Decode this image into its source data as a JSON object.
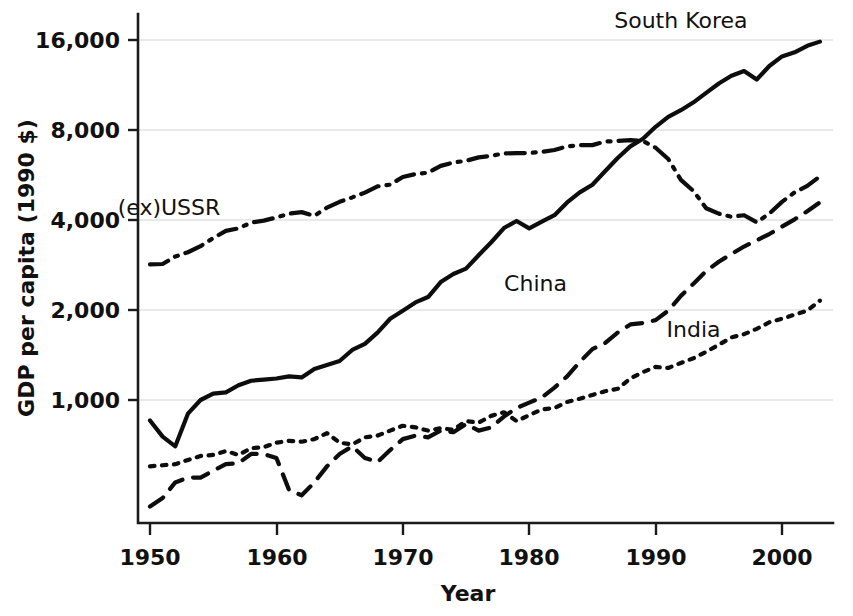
{
  "chart_data": {
    "type": "line",
    "title": "",
    "xlabel": "Year",
    "ylabel": "GDP per capita (1990 $)",
    "yscale": "log",
    "xlim": [
      1950,
      2003
    ],
    "ylim": [
      380,
      18000
    ],
    "grid": true,
    "legend_position": "inline-labels",
    "xticks": [
      1950,
      1960,
      1970,
      1980,
      1990,
      2000
    ],
    "xticklabels": [
      "1950",
      "1960",
      "1970",
      "1980",
      "1990",
      "2000"
    ],
    "yticks": [
      1000,
      2000,
      4000,
      8000,
      16000
    ],
    "yticklabels": [
      "1,000",
      "2,000",
      "4,000",
      "8,000",
      "16,000"
    ],
    "series": [
      {
        "name": "South Korea",
        "style": "solid",
        "label_x": 1992,
        "label_y": 17500,
        "x": [
          1950,
          1951,
          1952,
          1953,
          1954,
          1955,
          1956,
          1957,
          1958,
          1959,
          1960,
          1961,
          1962,
          1963,
          1964,
          1965,
          1966,
          1967,
          1968,
          1969,
          1970,
          1971,
          1972,
          1973,
          1974,
          1975,
          1976,
          1977,
          1978,
          1979,
          1980,
          1981,
          1982,
          1983,
          1984,
          1985,
          1986,
          1987,
          1988,
          1989,
          1990,
          1991,
          1992,
          1993,
          1994,
          1995,
          1996,
          1997,
          1998,
          1999,
          2000,
          2001,
          2002,
          2003
        ],
        "y": [
          854,
          754,
          700,
          900,
          1000,
          1050,
          1060,
          1120,
          1160,
          1170,
          1180,
          1200,
          1190,
          1270,
          1310,
          1350,
          1470,
          1540,
          1680,
          1870,
          1990,
          2120,
          2210,
          2480,
          2640,
          2750,
          3050,
          3370,
          3760,
          3970,
          3750,
          3950,
          4150,
          4580,
          4950,
          5250,
          5820,
          6450,
          7050,
          7480,
          8200,
          8850,
          9320,
          9900,
          10650,
          11450,
          12150,
          12600,
          11800,
          13100,
          14100,
          14550,
          15300,
          15800
        ]
      },
      {
        "name": "(ex)USSR",
        "style": "dashdot",
        "label_x": 1951.5,
        "label_y": 4150,
        "x": [
          1950,
          1951,
          1952,
          1953,
          1954,
          1955,
          1956,
          1957,
          1958,
          1959,
          1960,
          1961,
          1962,
          1963,
          1964,
          1965,
          1966,
          1967,
          1968,
          1969,
          1970,
          1971,
          1972,
          1973,
          1974,
          1975,
          1976,
          1977,
          1978,
          1979,
          1980,
          1981,
          1982,
          1983,
          1984,
          1985,
          1986,
          1987,
          1988,
          1989,
          1990,
          1991,
          1992,
          1993,
          1994,
          1995,
          1996,
          1997,
          1998,
          1999,
          2000,
          2001,
          2002,
          2003
        ],
        "y": [
          2840,
          2850,
          3020,
          3120,
          3270,
          3480,
          3680,
          3750,
          3920,
          3980,
          4080,
          4200,
          4250,
          4130,
          4400,
          4600,
          4760,
          4940,
          5180,
          5250,
          5570,
          5700,
          5760,
          6070,
          6230,
          6310,
          6480,
          6560,
          6680,
          6700,
          6700,
          6760,
          6860,
          7050,
          7120,
          7120,
          7320,
          7350,
          7400,
          7350,
          6980,
          6400,
          5450,
          5000,
          4380,
          4200,
          4100,
          4150,
          3930,
          4200,
          4600,
          4950,
          5200,
          5600
        ]
      },
      {
        "name": "China",
        "style": "dashed",
        "label_x": 1980.5,
        "label_y": 2320,
        "x": [
          1950,
          1951,
          1952,
          1953,
          1954,
          1955,
          1956,
          1957,
          1958,
          1959,
          1960,
          1961,
          1962,
          1963,
          1964,
          1965,
          1966,
          1967,
          1968,
          1969,
          1970,
          1971,
          1972,
          1973,
          1974,
          1975,
          1976,
          1977,
          1978,
          1979,
          1980,
          1981,
          1982,
          1983,
          1984,
          1985,
          1986,
          1987,
          1988,
          1989,
          1990,
          1991,
          1992,
          1993,
          1994,
          1995,
          1996,
          1997,
          1998,
          1999,
          2000,
          2001,
          2002,
          2003
        ],
        "y": [
          440,
          470,
          530,
          550,
          550,
          580,
          610,
          615,
          660,
          660,
          640,
          500,
          480,
          530,
          600,
          660,
          700,
          640,
          620,
          680,
          740,
          760,
          750,
          790,
          780,
          830,
          790,
          810,
          880,
          940,
          980,
          1020,
          1100,
          1200,
          1340,
          1480,
          1550,
          1680,
          1790,
          1810,
          1850,
          1990,
          2230,
          2450,
          2700,
          2900,
          3080,
          3260,
          3420,
          3590,
          3800,
          4020,
          4280,
          4580
        ]
      },
      {
        "name": "India",
        "style": "dotted",
        "label_x": 1993,
        "label_y": 1620,
        "x": [
          1950,
          1951,
          1952,
          1953,
          1954,
          1955,
          1956,
          1957,
          1958,
          1959,
          1960,
          1961,
          1962,
          1963,
          1964,
          1965,
          1966,
          1967,
          1968,
          1969,
          1970,
          1971,
          1972,
          1973,
          1974,
          1975,
          1976,
          1977,
          1978,
          1979,
          1980,
          1981,
          1982,
          1983,
          1984,
          1985,
          1986,
          1987,
          1988,
          1989,
          1990,
          1991,
          1992,
          1993,
          1994,
          1995,
          1996,
          1997,
          1998,
          1999,
          2000,
          2001,
          2002,
          2003
        ],
        "y": [
          600,
          605,
          610,
          630,
          650,
          655,
          675,
          655,
          690,
          695,
          720,
          730,
          725,
          740,
          775,
          720,
          710,
          750,
          760,
          790,
          820,
          810,
          790,
          805,
          795,
          850,
          840,
          885,
          910,
          850,
          890,
          930,
          940,
          985,
          1010,
          1040,
          1070,
          1090,
          1180,
          1240,
          1290,
          1280,
          1330,
          1380,
          1450,
          1530,
          1620,
          1660,
          1730,
          1820,
          1870,
          1930,
          1990,
          2150
        ]
      }
    ]
  },
  "axes": {
    "x_title": "Year",
    "y_title": "GDP per capita (1990 $)"
  }
}
